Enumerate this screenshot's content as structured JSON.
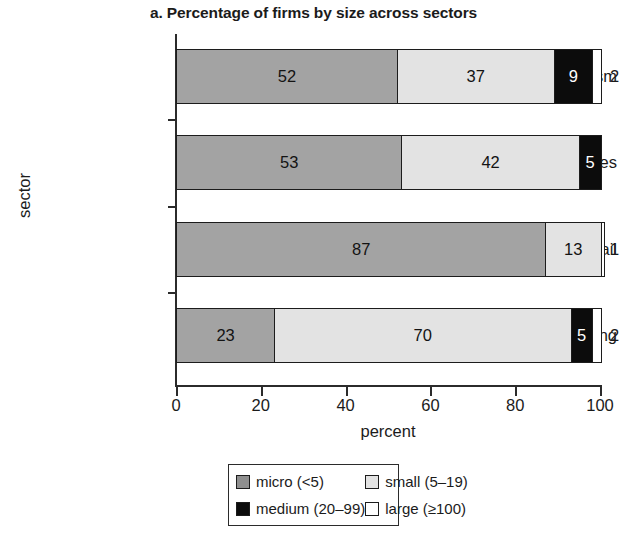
{
  "chart_data": {
    "type": "bar",
    "subtype": "stacked-horizontal-100",
    "title": "a. Percentage of firms by size across sectors",
    "xlabel": "percent",
    "ylabel": "sector",
    "xlim": [
      0,
      100
    ],
    "xticks": [
      "0",
      "20",
      "40",
      "60",
      "80",
      "100"
    ],
    "xtick_values": [
      0,
      20,
      40,
      60,
      80,
      100
    ],
    "grid": false,
    "legend_position": "bottom",
    "categories": [
      "tourism",
      "other services",
      "retail",
      "manufacturing"
    ],
    "series": [
      {
        "name": "micro (<5)",
        "color": "#a3a3a3",
        "values": [
          52,
          53,
          87,
          23
        ],
        "labels": [
          "52",
          "53",
          "87",
          "23"
        ]
      },
      {
        "name": "small (5-19)",
        "color": "#e3e3e3",
        "values": [
          37,
          42,
          13,
          70
        ],
        "labels": [
          "37",
          "42",
          "13",
          "70"
        ]
      },
      {
        "name": "medium (20-99)",
        "color": "#0c0c0c",
        "values": [
          9,
          5,
          0,
          5
        ],
        "labels": [
          "9",
          "5",
          "",
          "5"
        ]
      },
      {
        "name": "large (>=100)",
        "color": "#ffffff",
        "values": [
          2,
          0,
          0,
          2
        ],
        "labels": [
          "",
          "",
          "",
          ""
        ]
      }
    ],
    "outside_labels": [
      "2",
      "",
      "1",
      "2"
    ],
    "annotations": [
      "tourism: 52 micro, 37 small, 9 medium, 2 large",
      "other services: 53 micro, 42 small, 5 medium",
      "retail: 87 micro, 13 small, 1 large",
      "manufacturing: 23 micro, 70 small, 5 medium, 2 large"
    ]
  },
  "legend": {
    "entries": [
      {
        "label": "micro (<5)",
        "color": "#8f8f8f"
      },
      {
        "label": "small (5–19)",
        "color": "#e3e3e3"
      },
      {
        "label": "medium (20–99)",
        "color": "#0c0c0c"
      },
      {
        "label": "large (≥100)",
        "color": "#ffffff"
      }
    ]
  },
  "rows": [
    {
      "category": "tourism",
      "segments": [
        {
          "size": "micro",
          "value": 52,
          "label": "52"
        },
        {
          "size": "small",
          "value": 37,
          "label": "37"
        },
        {
          "size": "medium",
          "value": 9,
          "label": "9"
        },
        {
          "size": "large",
          "value": 2,
          "label": ""
        }
      ],
      "outside": "2"
    },
    {
      "category": "other services",
      "segments": [
        {
          "size": "micro",
          "value": 53,
          "label": "53"
        },
        {
          "size": "small",
          "value": 42,
          "label": "42"
        },
        {
          "size": "medium",
          "value": 5,
          "label": "5"
        },
        {
          "size": "large",
          "value": 0,
          "label": ""
        }
      ],
      "outside": ""
    },
    {
      "category": "retail",
      "segments": [
        {
          "size": "micro",
          "value": 87,
          "label": "87"
        },
        {
          "size": "small",
          "value": 13,
          "label": "13"
        },
        {
          "size": "medium",
          "value": 0,
          "label": ""
        },
        {
          "size": "large",
          "value": 0.8,
          "label": ""
        }
      ],
      "outside": "1"
    },
    {
      "category": "manufacturing",
      "segments": [
        {
          "size": "micro",
          "value": 23,
          "label": "23"
        },
        {
          "size": "small",
          "value": 70,
          "label": "70"
        },
        {
          "size": "medium",
          "value": 5,
          "label": "5"
        },
        {
          "size": "large",
          "value": 2,
          "label": ""
        }
      ],
      "outside": "2"
    }
  ]
}
